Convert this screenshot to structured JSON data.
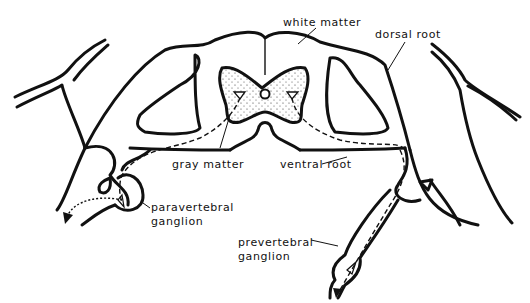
{
  "diagram": {
    "labels": {
      "white_matter": "white matter",
      "dorsal_root": "dorsal root",
      "gray_matter": "gray matter",
      "ventral_root": "ventral root",
      "paravertebral_line1": "paravertebral",
      "paravertebral_line2": "ganglion",
      "prevertebral_line1": "prevertebral",
      "prevertebral_line2": "ganglion"
    }
  }
}
